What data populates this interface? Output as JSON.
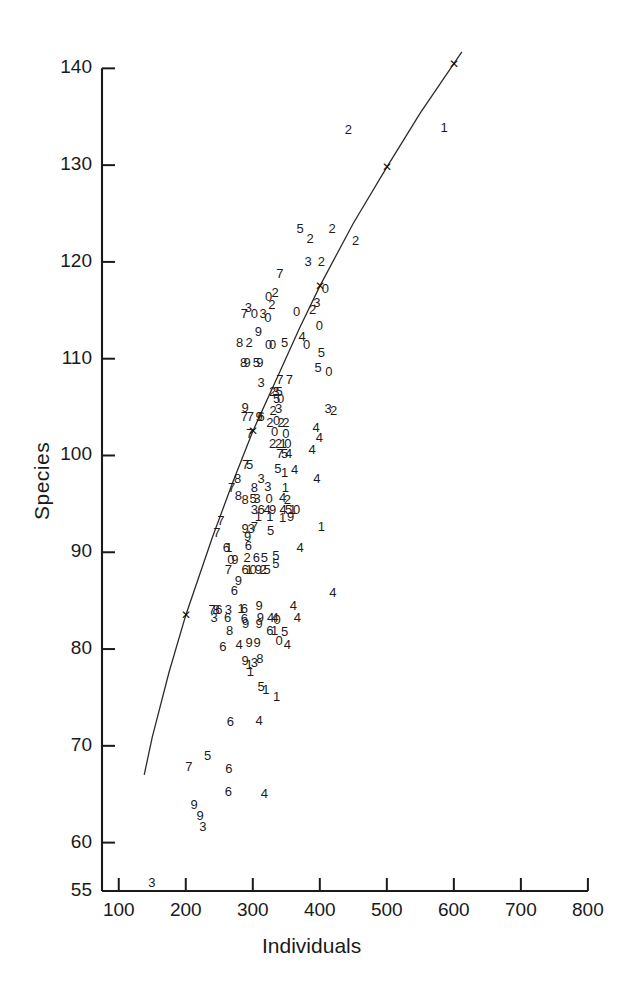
{
  "chart_data": {
    "type": "scatter",
    "title": "",
    "xlabel": "Individuals",
    "ylabel": "Species",
    "xlim": [
      75,
      830
    ],
    "ylim": [
      55,
      142
    ],
    "grid": false,
    "legend": null,
    "axis": {
      "x_ticks": [
        100,
        200,
        300,
        400,
        500,
        600,
        700,
        800
      ],
      "x_tick_labels": [
        "100",
        "200",
        "300",
        "400",
        "500",
        "600",
        "700",
        "800"
      ],
      "y_ticks": [
        55,
        60,
        70,
        80,
        90,
        100,
        110,
        120,
        130,
        140
      ],
      "y_tick_labels": [
        "55",
        "60",
        "70",
        "80",
        "90",
        "100",
        "110",
        "120",
        "130",
        "140"
      ]
    },
    "marker_style": "digit-glyph-labels",
    "note_marker_semantics": "each plotted observation is drawn as a single digit character used as its plotting symbol",
    "points": [
      {
        "x": 150,
        "y": 55.8,
        "label": "3"
      },
      {
        "x": 205,
        "y": 67.8,
        "label": "7"
      },
      {
        "x": 233,
        "y": 69.0,
        "label": "5"
      },
      {
        "x": 265,
        "y": 67.6,
        "label": "6"
      },
      {
        "x": 264,
        "y": 65.2,
        "label": "6"
      },
      {
        "x": 318,
        "y": 65.0,
        "label": "4"
      },
      {
        "x": 213,
        "y": 63.9,
        "label": "9"
      },
      {
        "x": 222,
        "y": 62.8,
        "label": "9"
      },
      {
        "x": 226,
        "y": 61.6,
        "label": "3"
      },
      {
        "x": 267,
        "y": 72.5,
        "label": "6"
      },
      {
        "x": 310,
        "y": 72.6,
        "label": "4"
      },
      {
        "x": 336,
        "y": 75.0,
        "label": "1"
      },
      {
        "x": 313,
        "y": 76.1,
        "label": "5"
      },
      {
        "x": 320,
        "y": 75.8,
        "label": "1"
      },
      {
        "x": 289,
        "y": 78.8,
        "label": "9"
      },
      {
        "x": 295,
        "y": 78.4,
        "label": "1"
      },
      {
        "x": 303,
        "y": 78.6,
        "label": "3"
      },
      {
        "x": 311,
        "y": 79.0,
        "label": "8"
      },
      {
        "x": 297,
        "y": 77.6,
        "label": "1"
      },
      {
        "x": 256,
        "y": 80.2,
        "label": "6"
      },
      {
        "x": 280,
        "y": 80.4,
        "label": "4"
      },
      {
        "x": 295,
        "y": 80.6,
        "label": "9"
      },
      {
        "x": 307,
        "y": 80.6,
        "label": "9"
      },
      {
        "x": 352,
        "y": 80.4,
        "label": "4"
      },
      {
        "x": 340,
        "y": 80.8,
        "label": "0"
      },
      {
        "x": 348,
        "y": 81.8,
        "label": "5"
      },
      {
        "x": 266,
        "y": 81.9,
        "label": "8"
      },
      {
        "x": 290,
        "y": 82.6,
        "label": "9"
      },
      {
        "x": 310,
        "y": 82.6,
        "label": "9"
      },
      {
        "x": 326,
        "y": 81.9,
        "label": "6"
      },
      {
        "x": 333,
        "y": 81.9,
        "label": "1"
      },
      {
        "x": 337,
        "y": 83.0,
        "label": "0"
      },
      {
        "x": 367,
        "y": 83.2,
        "label": "4"
      },
      {
        "x": 240,
        "y": 84.0,
        "label": "7"
      },
      {
        "x": 246,
        "y": 84.0,
        "label": "8"
      },
      {
        "x": 250,
        "y": 84.0,
        "label": "6"
      },
      {
        "x": 264,
        "y": 84.0,
        "label": "3"
      },
      {
        "x": 283,
        "y": 84.1,
        "label": "1"
      },
      {
        "x": 288,
        "y": 84.1,
        "label": "6"
      },
      {
        "x": 243,
        "y": 83.2,
        "label": "3"
      },
      {
        "x": 263,
        "y": 83.2,
        "label": "6"
      },
      {
        "x": 288,
        "y": 83.1,
        "label": "6"
      },
      {
        "x": 312,
        "y": 83.2,
        "label": "9"
      },
      {
        "x": 327,
        "y": 83.2,
        "label": "4"
      },
      {
        "x": 334,
        "y": 83.2,
        "label": "4"
      },
      {
        "x": 310,
        "y": 84.4,
        "label": "9"
      },
      {
        "x": 361,
        "y": 84.4,
        "label": "4"
      },
      {
        "x": 420,
        "y": 85.8,
        "label": "4"
      },
      {
        "x": 273,
        "y": 86.0,
        "label": "6"
      },
      {
        "x": 279,
        "y": 87.0,
        "label": "9"
      },
      {
        "x": 264,
        "y": 88.2,
        "label": "7"
      },
      {
        "x": 289,
        "y": 88.2,
        "label": "6"
      },
      {
        "x": 295,
        "y": 88.2,
        "label": "1"
      },
      {
        "x": 301,
        "y": 88.2,
        "label": "0"
      },
      {
        "x": 309,
        "y": 88.2,
        "label": "9"
      },
      {
        "x": 316,
        "y": 88.2,
        "label": "2"
      },
      {
        "x": 322,
        "y": 88.2,
        "label": "5"
      },
      {
        "x": 268,
        "y": 89.2,
        "label": "0"
      },
      {
        "x": 274,
        "y": 89.2,
        "label": "9"
      },
      {
        "x": 292,
        "y": 89.4,
        "label": "2"
      },
      {
        "x": 306,
        "y": 89.4,
        "label": "6"
      },
      {
        "x": 318,
        "y": 89.4,
        "label": "5"
      },
      {
        "x": 335,
        "y": 89.6,
        "label": "5"
      },
      {
        "x": 335,
        "y": 88.8,
        "label": "5"
      },
      {
        "x": 261,
        "y": 90.4,
        "label": "6"
      },
      {
        "x": 265,
        "y": 90.4,
        "label": "1"
      },
      {
        "x": 371,
        "y": 90.4,
        "label": "4"
      },
      {
        "x": 294,
        "y": 90.6,
        "label": "6"
      },
      {
        "x": 293,
        "y": 91.6,
        "label": "9"
      },
      {
        "x": 247,
        "y": 92.0,
        "label": "7"
      },
      {
        "x": 289,
        "y": 92.4,
        "label": "9"
      },
      {
        "x": 298,
        "y": 92.4,
        "label": "3"
      },
      {
        "x": 303,
        "y": 92.6,
        "label": "7"
      },
      {
        "x": 327,
        "y": 92.2,
        "label": "5"
      },
      {
        "x": 403,
        "y": 92.6,
        "label": "1"
      },
      {
        "x": 253,
        "y": 93.2,
        "label": "7"
      },
      {
        "x": 309,
        "y": 93.6,
        "label": "1"
      },
      {
        "x": 326,
        "y": 93.6,
        "label": "1"
      },
      {
        "x": 345,
        "y": 93.5,
        "label": "1"
      },
      {
        "x": 357,
        "y": 93.6,
        "label": "9"
      },
      {
        "x": 303,
        "y": 94.4,
        "label": "3"
      },
      {
        "x": 313,
        "y": 94.4,
        "label": "6"
      },
      {
        "x": 322,
        "y": 94.4,
        "label": "4"
      },
      {
        "x": 330,
        "y": 94.4,
        "label": "9"
      },
      {
        "x": 346,
        "y": 94.4,
        "label": "4"
      },
      {
        "x": 354,
        "y": 94.4,
        "label": "5"
      },
      {
        "x": 360,
        "y": 94.4,
        "label": "1"
      },
      {
        "x": 366,
        "y": 94.4,
        "label": "0"
      },
      {
        "x": 289,
        "y": 95.4,
        "label": "8"
      },
      {
        "x": 301,
        "y": 95.5,
        "label": "5"
      },
      {
        "x": 307,
        "y": 95.5,
        "label": "3"
      },
      {
        "x": 325,
        "y": 95.5,
        "label": "0"
      },
      {
        "x": 345,
        "y": 95.6,
        "label": "4"
      },
      {
        "x": 352,
        "y": 95.4,
        "label": "2"
      },
      {
        "x": 279,
        "y": 95.8,
        "label": "8"
      },
      {
        "x": 269,
        "y": 96.6,
        "label": "7"
      },
      {
        "x": 303,
        "y": 96.6,
        "label": "8"
      },
      {
        "x": 323,
        "y": 96.7,
        "label": "3"
      },
      {
        "x": 349,
        "y": 96.6,
        "label": "1"
      },
      {
        "x": 278,
        "y": 97.6,
        "label": "8"
      },
      {
        "x": 313,
        "y": 97.6,
        "label": "3"
      },
      {
        "x": 338,
        "y": 98.6,
        "label": "5"
      },
      {
        "x": 348,
        "y": 98.2,
        "label": "1"
      },
      {
        "x": 363,
        "y": 98.5,
        "label": "4"
      },
      {
        "x": 396,
        "y": 97.6,
        "label": "4"
      },
      {
        "x": 290,
        "y": 99.0,
        "label": "7"
      },
      {
        "x": 296,
        "y": 99.0,
        "label": "5"
      },
      {
        "x": 341,
        "y": 100.2,
        "label": "7"
      },
      {
        "x": 348,
        "y": 100.2,
        "label": "5"
      },
      {
        "x": 354,
        "y": 100.2,
        "label": "4"
      },
      {
        "x": 389,
        "y": 100.6,
        "label": "4"
      },
      {
        "x": 330,
        "y": 101.2,
        "label": "2"
      },
      {
        "x": 339,
        "y": 101.2,
        "label": "2"
      },
      {
        "x": 346,
        "y": 101.2,
        "label": "1"
      },
      {
        "x": 353,
        "y": 101.2,
        "label": "0"
      },
      {
        "x": 400,
        "y": 101.8,
        "label": "4"
      },
      {
        "x": 296,
        "y": 102.2,
        "label": "7"
      },
      {
        "x": 333,
        "y": 102.4,
        "label": "0"
      },
      {
        "x": 350,
        "y": 102.2,
        "label": "0"
      },
      {
        "x": 395,
        "y": 102.8,
        "label": "4"
      },
      {
        "x": 326,
        "y": 103.4,
        "label": "2"
      },
      {
        "x": 336,
        "y": 103.6,
        "label": "0"
      },
      {
        "x": 343,
        "y": 103.4,
        "label": "2"
      },
      {
        "x": 350,
        "y": 103.4,
        "label": "2"
      },
      {
        "x": 288,
        "y": 104.0,
        "label": "7"
      },
      {
        "x": 297,
        "y": 104.0,
        "label": "7"
      },
      {
        "x": 310,
        "y": 104.0,
        "label": "9"
      },
      {
        "x": 313,
        "y": 104.0,
        "label": "6"
      },
      {
        "x": 289,
        "y": 104.9,
        "label": "9"
      },
      {
        "x": 331,
        "y": 104.6,
        "label": "2"
      },
      {
        "x": 339,
        "y": 104.8,
        "label": "3"
      },
      {
        "x": 413,
        "y": 104.8,
        "label": "3"
      },
      {
        "x": 421,
        "y": 104.6,
        "label": "2"
      },
      {
        "x": 336,
        "y": 105.8,
        "label": "5"
      },
      {
        "x": 342,
        "y": 105.8,
        "label": "0"
      },
      {
        "x": 330,
        "y": 106.6,
        "label": "2"
      },
      {
        "x": 335,
        "y": 106.6,
        "label": "3"
      },
      {
        "x": 340,
        "y": 106.6,
        "label": "5"
      },
      {
        "x": 313,
        "y": 107.5,
        "label": "3"
      },
      {
        "x": 341,
        "y": 107.8,
        "label": "7"
      },
      {
        "x": 355,
        "y": 107.8,
        "label": "7"
      },
      {
        "x": 398,
        "y": 109.0,
        "label": "5"
      },
      {
        "x": 414,
        "y": 108.6,
        "label": "0"
      },
      {
        "x": 287,
        "y": 109.6,
        "label": "8"
      },
      {
        "x": 292,
        "y": 109.6,
        "label": "9"
      },
      {
        "x": 306,
        "y": 109.6,
        "label": "5"
      },
      {
        "x": 311,
        "y": 109.6,
        "label": "9"
      },
      {
        "x": 403,
        "y": 110.6,
        "label": "5"
      },
      {
        "x": 281,
        "y": 111.6,
        "label": "8"
      },
      {
        "x": 295,
        "y": 111.6,
        "label": "2"
      },
      {
        "x": 324,
        "y": 111.4,
        "label": "0"
      },
      {
        "x": 330,
        "y": 111.4,
        "label": "0"
      },
      {
        "x": 348,
        "y": 111.6,
        "label": "5"
      },
      {
        "x": 374,
        "y": 112.2,
        "label": "4"
      },
      {
        "x": 381,
        "y": 111.4,
        "label": "0"
      },
      {
        "x": 309,
        "y": 112.8,
        "label": "9"
      },
      {
        "x": 400,
        "y": 113.4,
        "label": "0"
      },
      {
        "x": 323,
        "y": 114.2,
        "label": "0"
      },
      {
        "x": 288,
        "y": 114.6,
        "label": "7"
      },
      {
        "x": 294,
        "y": 115.2,
        "label": "3"
      },
      {
        "x": 303,
        "y": 114.6,
        "label": "0"
      },
      {
        "x": 316,
        "y": 114.6,
        "label": "3"
      },
      {
        "x": 366,
        "y": 114.8,
        "label": "0"
      },
      {
        "x": 390,
        "y": 115.0,
        "label": "2"
      },
      {
        "x": 329,
        "y": 115.6,
        "label": "2"
      },
      {
        "x": 396,
        "y": 115.8,
        "label": "3"
      },
      {
        "x": 324,
        "y": 116.4,
        "label": "0"
      },
      {
        "x": 334,
        "y": 116.8,
        "label": "2"
      },
      {
        "x": 409,
        "y": 117.2,
        "label": "0"
      },
      {
        "x": 341,
        "y": 118.8,
        "label": "7"
      },
      {
        "x": 383,
        "y": 120.0,
        "label": "3"
      },
      {
        "x": 403,
        "y": 120.0,
        "label": "2"
      },
      {
        "x": 386,
        "y": 122.4,
        "label": "2"
      },
      {
        "x": 454,
        "y": 122.2,
        "label": "2"
      },
      {
        "x": 371,
        "y": 123.4,
        "label": "5"
      },
      {
        "x": 419,
        "y": 123.4,
        "label": "2"
      },
      {
        "x": 443,
        "y": 133.6,
        "label": "2"
      },
      {
        "x": 586,
        "y": 133.8,
        "label": "1"
      }
    ],
    "fitted_curve": {
      "label": "",
      "style": "solid-thin",
      "marker": "x",
      "marker_points": [
        {
          "x": 200,
          "y": 83.5
        },
        {
          "x": 300,
          "y": 102.5
        },
        {
          "x": 400,
          "y": 117.5
        },
        {
          "x": 500,
          "y": 129.8
        },
        {
          "x": 600,
          "y": 140.5
        }
      ],
      "path_points": [
        {
          "x": 138,
          "y": 67.0
        },
        {
          "x": 150,
          "y": 70.9
        },
        {
          "x": 175,
          "y": 77.6
        },
        {
          "x": 200,
          "y": 83.5
        },
        {
          "x": 240,
          "y": 91.6
        },
        {
          "x": 270,
          "y": 97.2
        },
        {
          "x": 300,
          "y": 102.5
        },
        {
          "x": 340,
          "y": 108.6
        },
        {
          "x": 370,
          "y": 113.2
        },
        {
          "x": 400,
          "y": 117.5
        },
        {
          "x": 450,
          "y": 124.0
        },
        {
          "x": 500,
          "y": 129.8
        },
        {
          "x": 550,
          "y": 135.4
        },
        {
          "x": 600,
          "y": 140.5
        },
        {
          "x": 612,
          "y": 141.7
        }
      ]
    }
  }
}
